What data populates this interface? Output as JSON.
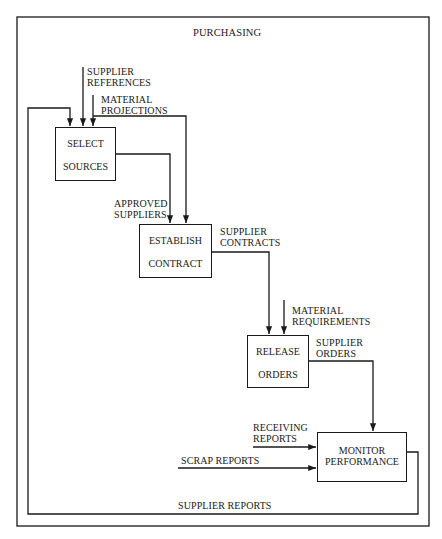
{
  "diagram": {
    "title": "PURCHASING",
    "stroke_color": "#1a1a1a",
    "boxes": [
      {
        "id": "select-sources",
        "line1": "SELECT",
        "line2": "SOURCES"
      },
      {
        "id": "establish-contract",
        "line1": "ESTABLISH",
        "line2": "CONTRACT"
      },
      {
        "id": "release-orders",
        "line1": "RELEASE",
        "line2": "ORDERS"
      },
      {
        "id": "monitor-performance",
        "line1": "MONITOR",
        "line2": "PERFORMANCE"
      }
    ],
    "flows": {
      "supplier_references": {
        "line1": "SUPPLIER",
        "line2": "REFERENCES"
      },
      "material_projections": {
        "line1": "MATERIAL",
        "line2": "PROJECTIONS"
      },
      "approved_suppliers": {
        "line1": "APPROVED",
        "line2": "SUPPLIERS"
      },
      "supplier_contracts": {
        "line1": "SUPPLIER",
        "line2": "CONTRACTS"
      },
      "material_requirements": {
        "line1": "MATERIAL",
        "line2": "REQUIREMENTS"
      },
      "supplier_orders": {
        "line1": "SUPPLIER",
        "line2": "ORDERS"
      },
      "receiving_reports": {
        "line1": "RECEIVING",
        "line2": "REPORTS"
      },
      "scrap_reports": {
        "line1": "SCRAP REPORTS"
      },
      "supplier_reports": {
        "line1": "SUPPLIER REPORTS"
      }
    }
  }
}
